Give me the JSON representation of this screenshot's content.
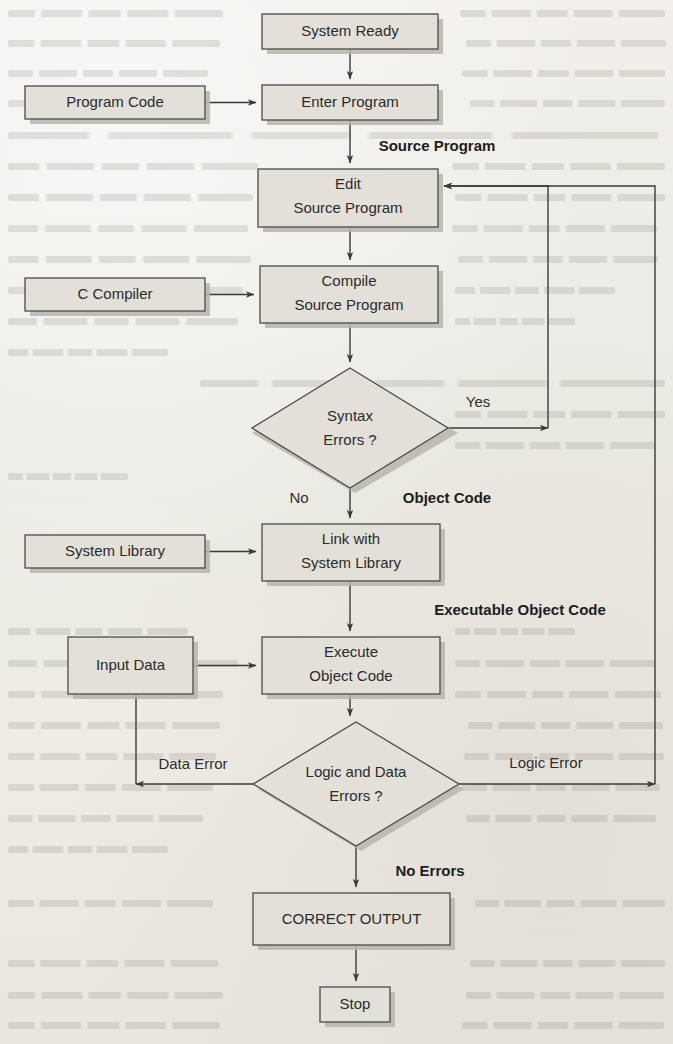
{
  "diagram": {
    "background_color": "#efece7",
    "shape_fill_color": "#e3e0da",
    "shape_stroke_color": "#4a4a4a",
    "connector_color": "#3b3b3b",
    "text_color": "#2b2b2b"
  },
  "nodes": {
    "system_ready": {
      "label": "System Ready",
      "shape": "rectangle",
      "x": 262,
      "y": 14,
      "w": 176,
      "h": 35
    },
    "program_code": {
      "label": "Program Code",
      "shape": "rectangle",
      "x": 25,
      "y": 86,
      "w": 180,
      "h": 33
    },
    "enter_program": {
      "label": "Enter Program",
      "shape": "rectangle",
      "x": 262,
      "y": 85,
      "w": 176,
      "h": 35
    },
    "edit_source_program": {
      "label_line1": "Edit",
      "label_line2": "Source Program",
      "shape": "rectangle",
      "x": 258,
      "y": 169,
      "w": 180,
      "h": 58
    },
    "c_compiler": {
      "label": "C Compiler",
      "shape": "rectangle",
      "x": 25,
      "y": 278,
      "w": 180,
      "h": 33
    },
    "compile_source_program": {
      "label_line1": "Compile",
      "label_line2": "Source Program",
      "shape": "rectangle",
      "x": 260,
      "y": 266,
      "w": 178,
      "h": 57
    },
    "syntax_errors": {
      "label_line1": "Syntax",
      "label_line2": "Errors ?",
      "shape": "diamond",
      "cx": 350,
      "cy": 428,
      "rx": 98,
      "ry": 60
    },
    "system_library": {
      "label": "System Library",
      "shape": "rectangle",
      "x": 25,
      "y": 535,
      "w": 180,
      "h": 33
    },
    "link_with_system_library": {
      "label_line1": "Link with",
      "label_line2": "System Library",
      "shape": "rectangle",
      "x": 262,
      "y": 524,
      "w": 178,
      "h": 57
    },
    "input_data": {
      "label": "Input Data",
      "shape": "rectangle",
      "x": 68,
      "y": 637,
      "w": 125,
      "h": 57
    },
    "execute_object_code": {
      "label_line1": "Execute",
      "label_line2": "Object Code",
      "shape": "rectangle",
      "x": 262,
      "y": 637,
      "w": 178,
      "h": 57
    },
    "logic_and_data_errors": {
      "label_line1": "Logic and Data",
      "label_line2": "Errors ?",
      "shape": "diamond",
      "cx": 356,
      "cy": 784,
      "rx": 103,
      "ry": 62
    },
    "correct_output": {
      "label": "CORRECT OUTPUT",
      "shape": "rectangle",
      "x": 253,
      "y": 893,
      "w": 197,
      "h": 52
    },
    "stop": {
      "label": "Stop",
      "shape": "rectangle",
      "x": 320,
      "y": 987,
      "w": 70,
      "h": 35
    }
  },
  "edge_labels": {
    "source_program": {
      "text": "Source Program",
      "bold": true,
      "x": 437,
      "y": 147
    },
    "yes": {
      "text": "Yes",
      "bold": false,
      "x": 478,
      "y": 403
    },
    "no": {
      "text": "No",
      "bold": false,
      "x": 299,
      "y": 499
    },
    "object_code": {
      "text": "Object Code",
      "bold": true,
      "x": 447,
      "y": 499
    },
    "executable_object_code": {
      "text": "Executable Object Code",
      "bold": true,
      "x": 520,
      "y": 611
    },
    "data_error": {
      "text": "Data Error",
      "bold": false,
      "x": 193,
      "y": 765
    },
    "logic_error": {
      "text": "Logic Error",
      "bold": false,
      "x": 546,
      "y": 764
    },
    "no_errors": {
      "text": "No Errors",
      "bold": true,
      "x": 430,
      "y": 872
    }
  },
  "flow": {
    "edges": [
      {
        "from": "system_ready",
        "to": "enter_program",
        "label": ""
      },
      {
        "from": "program_code",
        "to": "enter_program",
        "label": ""
      },
      {
        "from": "enter_program",
        "to": "edit_source_program",
        "label": "Source Program"
      },
      {
        "from": "edit_source_program",
        "to": "compile_source_program",
        "label": ""
      },
      {
        "from": "c_compiler",
        "to": "compile_source_program",
        "label": ""
      },
      {
        "from": "compile_source_program",
        "to": "syntax_errors",
        "label": ""
      },
      {
        "from": "syntax_errors",
        "to": "edit_source_program",
        "label": "Yes"
      },
      {
        "from": "syntax_errors",
        "to": "link_with_system_library",
        "label": "No / Object Code"
      },
      {
        "from": "system_library",
        "to": "link_with_system_library",
        "label": ""
      },
      {
        "from": "link_with_system_library",
        "to": "execute_object_code",
        "label": "Executable Object Code"
      },
      {
        "from": "input_data",
        "to": "execute_object_code",
        "label": ""
      },
      {
        "from": "execute_object_code",
        "to": "logic_and_data_errors",
        "label": ""
      },
      {
        "from": "logic_and_data_errors",
        "to": "input_data",
        "label": "Data Error"
      },
      {
        "from": "logic_and_data_errors",
        "to": "edit_source_program",
        "label": "Logic Error"
      },
      {
        "from": "logic_and_data_errors",
        "to": "correct_output",
        "label": "No Errors"
      },
      {
        "from": "correct_output",
        "to": "stop",
        "label": ""
      }
    ]
  }
}
